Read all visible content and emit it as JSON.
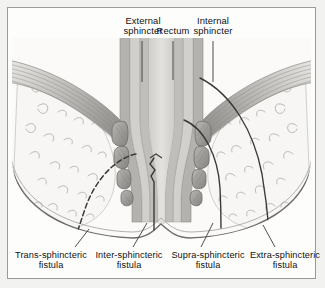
{
  "figure": {
    "title_labels_top": [
      {
        "id": "external-sphincter",
        "text_line1": "External",
        "text_line2": "sphincter",
        "x": 141,
        "y": 14,
        "leader_from_y": 40,
        "leader_to_y": 80
      },
      {
        "id": "rectum",
        "text_line1": "Rectum",
        "text_line2": "",
        "x": 172,
        "y": 24,
        "leader_from_y": 40,
        "leader_to_y": 78
      },
      {
        "id": "internal-sphincter",
        "text_line1": "Internal",
        "text_line2": "sphincter",
        "x": 212,
        "y": 14,
        "leader_from_y": 40,
        "leader_to_y": 80
      }
    ],
    "fistula_labels_bottom": [
      {
        "id": "trans-sphincteric",
        "text_line1": "Trans-sphincteric",
        "text_line2": "fistula",
        "x": 46,
        "y": 250,
        "leader_x1": 74,
        "leader_y1": 246,
        "leader_x2": 88,
        "leader_y2": 228
      },
      {
        "id": "inter-sphincteric",
        "text_line1": "Inter-sphincteric",
        "text_line2": "fistula",
        "x": 125,
        "y": 250,
        "leader_x1": 132,
        "leader_y1": 246,
        "leader_x2": 146,
        "leader_y2": 222
      },
      {
        "id": "supra-sphincteric",
        "text_line1": "Supra-sphincteric",
        "text_line2": "fistula",
        "x": 204,
        "y": 250,
        "leader_x1": 200,
        "leader_y1": 246,
        "leader_x2": 212,
        "leader_y2": 222
      },
      {
        "id": "extra-sphincteric",
        "text_line1": "Extra-sphincteric",
        "text_line2": "fistula",
        "x": 281,
        "y": 250,
        "leader_x1": 274,
        "leader_y1": 246,
        "leader_x2": 262,
        "leader_y2": 224
      }
    ],
    "colors": {
      "page_background": "#f2f2f0",
      "panel_background": "#fdfdfc",
      "panel_border": "#9a9a98",
      "fat_tissue": "#f6f5f3",
      "fat_squiggle": "#b9b7b4",
      "muscle_band": "#b0aeab",
      "muscle_band_dark": "#8e8c89",
      "sphincter_bundle": "#a9a7a4",
      "lumen": "#dddbd8",
      "mucosa": "#c9c7c4",
      "skin_line": "#6f6d6a",
      "fistula_tract": "#3c3a38",
      "label_text": "#111111"
    },
    "structures": {
      "rectum_lumen": "funnel-shaped central canal narrowing downward to anal verge",
      "internal_sphincter": "inner smooth muscle layer flanking the anal canal",
      "external_sphincter": "stacked rounded muscle bundles on each side of anal canal",
      "levator_ani": "banded striated muscle sweeping diagonally from upper corners to rectal wall",
      "ischiorectal_fat": "pale stippled fat spaces lateral to the sphincter complex",
      "perianal_skin": "curved outer contour with central bump at the anal verge"
    },
    "tracts": [
      {
        "id": "trans-sphincteric-tract",
        "description": "curves from anal canal through external sphincter into left ischiorectal fat, exiting skin at lower left"
      },
      {
        "id": "inter-sphincteric-tract",
        "description": "runs vertically in the plane between internal and external sphincters with zigzag at anal crypt"
      },
      {
        "id": "supra-sphincteric-tract",
        "description": "ascends above puborectalis then descends through right ischiorectal fat to skin"
      },
      {
        "id": "extra-sphincteric-tract",
        "description": "passes lateral to the entire sphincter complex from rectum to perianal skin"
      }
    ]
  }
}
